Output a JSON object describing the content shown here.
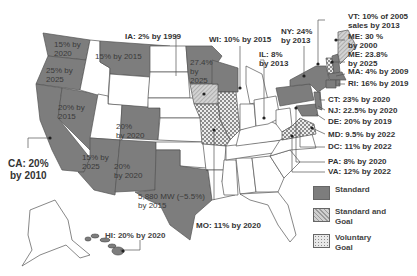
{
  "map": {
    "title": "US Renewable Portfolio Standards",
    "colors": {
      "standard": "#7d7d7d",
      "standard_and_goal": "#c4c4c4",
      "voluntary_goal": "#e0e0e0",
      "none": "#ffffff",
      "border": "#555555"
    },
    "inside_labels": {
      "wa": "15% by\n2020",
      "or": "25% by\n2025",
      "mt": "15% by 2015",
      "mn": "27.4%\nby\n2025",
      "nv": "20% by\n2015",
      "co": "20%\nby 2020",
      "az": "15% by\n2025",
      "nm": "20%\nby 2020",
      "tx": "5,880 MW (~5.5%)\nby 2015"
    },
    "callouts": {
      "ca": "CA: 20%\nby 2010",
      "ia": "IA: 2% by 1999",
      "wi": "WI: 10% by 2015",
      "il": "IL: 8%\nby 2013",
      "ny": "NY: 24%\nby 2013",
      "vt": "VT: 10% of 2005\nsales by 2013",
      "me1": "ME: 30 %\nby 2000",
      "me2": "ME: 23.8%\nby 2025",
      "ma": "MA: 4% by 2009",
      "ri": "RI: 16% by 2019",
      "ct": "CT: 23% by 2020",
      "nj": "NJ: 22.5% by 2020",
      "de": "DE: 20% by 2019",
      "md": "MD: 9.5% by 2022",
      "dc": "DC: 11% by 2022",
      "pa": "PA: 8% by 2020",
      "va": "VA: 12% by 2022",
      "mo": "MO: 11% by 2020",
      "hi": "HI: 20% by 2020"
    }
  },
  "legend": {
    "items": [
      {
        "label": "Standard",
        "pattern": "solid"
      },
      {
        "label": "Standard and\nGoal",
        "pattern": "hatched"
      },
      {
        "label": "Voluntary\nGoal",
        "pattern": "checkered"
      }
    ]
  }
}
